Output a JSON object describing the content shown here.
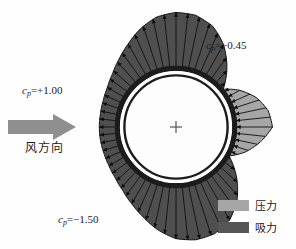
{
  "figure": {
    "background_color": "#fefefe"
  },
  "labels": {
    "cp_windward": {
      "symbol": "c",
      "subscript": "p",
      "value": "=+1.00",
      "full": "cp=+1.00"
    },
    "cp_top": {
      "symbol": "c",
      "subscript": "p",
      "value": "=−0.45",
      "full": "cp=-0.45"
    },
    "cp_side": {
      "symbol": "c",
      "subscript": "p",
      "value": "=−1.50",
      "full": "cp=-1.50"
    }
  },
  "wind": {
    "arrow_label": "风方向",
    "arrow_color": "#8f8f8f",
    "direction": "left-to-right"
  },
  "legend": {
    "items": [
      {
        "label": "压力",
        "color": "#a6a6a6",
        "meaning": "pressure"
      },
      {
        "label": "吸力",
        "color": "#565656",
        "meaning": "suction"
      }
    ]
  },
  "colors": {
    "pressure": "#a6a6a6",
    "suction": "#4f4f4f",
    "cylinder_ring": "#1c1c1c",
    "cylinder_gap": "#ffffff",
    "outline": "#111111",
    "text": "#1a1a1a"
  },
  "geometry": {
    "center_x": 176,
    "center_y": 127,
    "ring_outer_radius": 58,
    "ring_inner_radius": 52,
    "center_marker": "+"
  },
  "chart_data": {
    "type": "line",
    "xlabel": "Angle from windward stagnation point (degrees)",
    "ylabel": "Pressure coefficient cp",
    "ylim": [
      -1.6,
      1.1
    ],
    "grid": false,
    "legend_position": "bottom-right",
    "annotations": [
      {
        "text": "cp=+1.00",
        "angle_deg": 180,
        "value": 1.0
      },
      {
        "text": "cp=-0.45",
        "angle_deg": 0,
        "value": -0.45
      },
      {
        "text": "cp=-1.50",
        "angle_deg": 90,
        "value": -1.5
      }
    ],
    "series": [
      {
        "name": "cp",
        "angles_deg": [
          0,
          10,
          20,
          30,
          40,
          50,
          60,
          70,
          80,
          90,
          100,
          110,
          120,
          130,
          140,
          150,
          160,
          170,
          180,
          190,
          200,
          210,
          220,
          230,
          240,
          250,
          260,
          270,
          280,
          290,
          300,
          310,
          320,
          330,
          340,
          350
        ],
        "values": [
          1.0,
          0.92,
          0.7,
          0.36,
          -0.06,
          -0.52,
          -0.96,
          -1.3,
          -1.47,
          -1.5,
          -1.42,
          -1.22,
          -0.98,
          -0.78,
          -0.62,
          -0.52,
          -0.47,
          -0.45,
          -0.45,
          -0.45,
          -0.45,
          -0.47,
          -0.52,
          -0.62,
          -0.78,
          -0.98,
          -1.22,
          -1.42,
          -1.5,
          -1.47,
          -1.3,
          -0.96,
          -0.52,
          -0.06,
          0.36,
          0.7
        ]
      }
    ]
  }
}
